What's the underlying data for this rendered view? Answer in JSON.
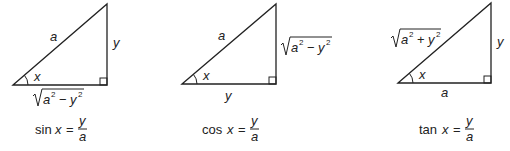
{
  "diagrams": [
    {
      "name": "sine",
      "hypotenuse": "a",
      "opposite": "y",
      "adjacent": "√(a² − y²)",
      "angle": "x",
      "formula": {
        "fn": "sin",
        "var": "x",
        "num": "y",
        "den": "a"
      }
    },
    {
      "name": "cosine",
      "hypotenuse": "a",
      "opposite": "√(a² − y²)",
      "adjacent": "y",
      "angle": "x",
      "formula": {
        "fn": "cos",
        "var": "x",
        "num": "y",
        "den": "a"
      }
    },
    {
      "name": "tangent",
      "hypotenuse": "√(a² + y²)",
      "opposite": "y",
      "adjacent": "a",
      "angle": "x",
      "formula": {
        "fn": "tan",
        "var": "x",
        "num": "y",
        "den": "a"
      }
    }
  ],
  "symbols": {
    "a": "a",
    "y": "y",
    "x": "x",
    "two": "2",
    "minus": "−",
    "plus": "+",
    "eq": "="
  }
}
